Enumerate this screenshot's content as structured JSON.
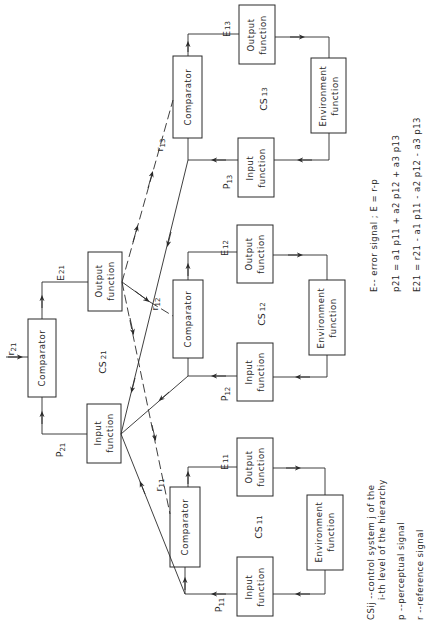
{
  "figure": {
    "orientation": "rotated-90-ccw",
    "blocks": {
      "cs13": {
        "label": "CS",
        "label_sub": "13",
        "comparator": "Comparator",
        "output_fn": [
          "Output",
          "function"
        ],
        "environment_fn": [
          "Environment",
          "function"
        ],
        "input_fn": [
          "Input",
          "function"
        ],
        "error": "E",
        "error_sub": "13",
        "perceptual": "P",
        "perceptual_sub": "13",
        "reference": "r",
        "reference_sub": "13"
      },
      "cs12": {
        "label": "CS",
        "label_sub": "12",
        "comparator": "Comparator",
        "output_fn": [
          "Output",
          "function"
        ],
        "environment_fn": [
          "Environment",
          "function"
        ],
        "input_fn": [
          "Input",
          "function"
        ],
        "error": "E",
        "error_sub": "12",
        "perceptual": "P",
        "perceptual_sub": "12",
        "reference": "r",
        "reference_sub": "12"
      },
      "cs11": {
        "label": "CS",
        "label_sub": "11",
        "comparator": "Comparator",
        "output_fn": [
          "Output",
          "function"
        ],
        "environment_fn": [
          "Environment",
          "function"
        ],
        "input_fn": [
          "Input",
          "function"
        ],
        "error": "E",
        "error_sub": "11",
        "perceptual": "P",
        "perceptual_sub": "11",
        "reference": "r",
        "reference_sub": "11"
      },
      "cs21": {
        "label": "CS",
        "label_sub": "21",
        "comparator": "Comparator",
        "output_fn": [
          "Output",
          "function"
        ],
        "input_fn": [
          "Input",
          "function"
        ],
        "error": "E",
        "error_sub": "21",
        "perceptual": "P",
        "perceptual_sub": "21",
        "reference": "r",
        "reference_sub": "21"
      }
    },
    "legend": {
      "csij_line1": "CSij --control system j of the",
      "csij_line2": "i-th level of the hierarchy",
      "p_line": "p  --perceptual signal",
      "r_line": "r  --reference signal"
    },
    "equations": {
      "error_def": "E-- error signal ; E = r-p",
      "p21": "p21 = a1 p11 + a2 p12 + a3 p13",
      "e21": "E21 = r21 - a1 p11 - a2 p12 - a3 p13"
    }
  }
}
